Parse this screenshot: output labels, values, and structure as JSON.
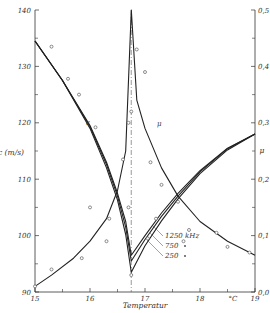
{
  "chart_data": {
    "type": "line",
    "title": "",
    "xlabel": "Temperatur",
    "x_unit": "°C",
    "ylabel_left": "c (m/s)",
    "ylabel_right": "μ",
    "xlim": [
      15,
      19
    ],
    "ylim_left": [
      90,
      140
    ],
    "ylim_right": [
      0.0,
      0.5
    ],
    "x_ticks": [
      "15",
      "16",
      "17",
      "18",
      "°C",
      "19"
    ],
    "y_left_ticks": [
      "90",
      "100",
      "110",
      "120",
      "130",
      "140"
    ],
    "y_right_ticks": [
      "0,0",
      "0,1",
      "0,2",
      "0,3",
      "0,4",
      "0,5"
    ],
    "grid": false,
    "critical_temperature_line": 16.75,
    "curve_labels": {
      "c": "c",
      "mu": "μ"
    },
    "legend": {
      "entries": [
        {
          "label": "1250 kHz",
          "marker": "o"
        },
        {
          "label": "750",
          "marker": "•"
        },
        {
          "label": "250",
          "marker": "•"
        }
      ]
    },
    "series": [
      {
        "name": "c 1250 kHz",
        "axis": "left",
        "x": [
          15.0,
          15.5,
          16.0,
          16.3,
          16.5,
          16.65,
          16.75,
          17.0,
          17.3,
          17.6,
          18.0,
          18.5,
          19.0
        ],
        "values": [
          134.5,
          127.5,
          119.5,
          113.0,
          107.5,
          102.5,
          96.5,
          100.0,
          104.0,
          107.5,
          111.5,
          115.5,
          118.0
        ]
      },
      {
        "name": "c 750 kHz",
        "axis": "left",
        "x": [
          15.0,
          15.5,
          16.0,
          16.3,
          16.5,
          16.65,
          16.75,
          17.0,
          17.3,
          17.6,
          18.0,
          18.5,
          19.0
        ],
        "values": [
          134.5,
          127.5,
          119.3,
          112.6,
          107.0,
          101.5,
          95.5,
          99.3,
          103.4,
          107.0,
          111.3,
          115.4,
          118.0
        ]
      },
      {
        "name": "c 250 kHz",
        "axis": "left",
        "x": [
          15.0,
          15.5,
          16.0,
          16.3,
          16.5,
          16.65,
          16.75,
          17.0,
          17.3,
          17.6,
          18.0,
          18.5,
          19.0
        ],
        "values": [
          134.5,
          127.5,
          119.0,
          112.0,
          106.3,
          100.2,
          93.5,
          98.2,
          102.6,
          106.5,
          111.0,
          115.2,
          118.0
        ]
      },
      {
        "name": "μ absorption",
        "axis": "right",
        "x": [
          15.0,
          15.3,
          15.7,
          16.0,
          16.3,
          16.5,
          16.65,
          16.75,
          16.85,
          17.0,
          17.3,
          17.6,
          18.0,
          18.5,
          19.0
        ],
        "values": [
          0.01,
          0.03,
          0.06,
          0.09,
          0.13,
          0.18,
          0.25,
          0.5,
          0.34,
          0.29,
          0.22,
          0.17,
          0.125,
          0.09,
          0.065
        ]
      }
    ],
    "points": {
      "c": [
        [
          15.3,
          133.5
        ],
        [
          15.6,
          127.8
        ],
        [
          15.8,
          125.0
        ],
        [
          16.1,
          119.2
        ],
        [
          16.6,
          113.5
        ],
        [
          16.7,
          105.0
        ],
        [
          16.75,
          93.0
        ],
        [
          17.05,
          99.5
        ],
        [
          17.2,
          103.0
        ]
      ],
      "mu": [
        [
          15.0,
          0.01
        ],
        [
          15.3,
          0.04
        ],
        [
          15.85,
          0.06
        ],
        [
          16.3,
          0.09
        ],
        [
          16.35,
          0.13
        ],
        [
          16.0,
          0.15
        ],
        [
          16.75,
          0.32
        ],
        [
          16.7,
          0.3
        ],
        [
          16.85,
          0.43
        ],
        [
          17.0,
          0.39
        ],
        [
          17.1,
          0.23
        ],
        [
          17.3,
          0.19
        ],
        [
          17.6,
          0.16
        ],
        [
          17.8,
          0.11
        ],
        [
          17.7,
          0.09
        ],
        [
          18.3,
          0.105
        ],
        [
          18.5,
          0.08
        ],
        [
          18.9,
          0.07
        ]
      ]
    }
  }
}
